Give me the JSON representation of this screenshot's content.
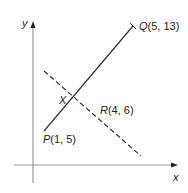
{
  "diagram": {
    "axes": {
      "x_label": "x",
      "y_label": "y",
      "axis_color": "#9a9a9a"
    },
    "points": {
      "P": {
        "name": "P",
        "coords": "(1, 5)"
      },
      "Q": {
        "name": "Q",
        "coords": "(5, 13)"
      },
      "R": {
        "name": "R",
        "coords": "(4, 6)"
      },
      "X": {
        "name": "X"
      }
    },
    "lines": [
      {
        "id": "PQ",
        "style": "solid",
        "from": "P",
        "to": "Q",
        "color": "#333333"
      },
      {
        "id": "perpendicular-through-R",
        "style": "dashed",
        "through": "R",
        "color": "#333333"
      }
    ]
  }
}
